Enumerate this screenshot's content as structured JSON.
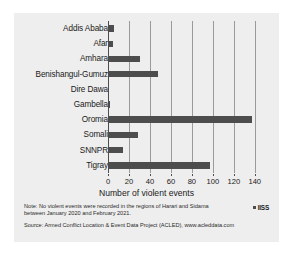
{
  "chart_data": {
    "type": "bar",
    "orientation": "horizontal",
    "title": "",
    "xlabel": "Number of violent events",
    "ylabel": "",
    "xlim": [
      0,
      145
    ],
    "xticks": [
      0,
      20,
      40,
      60,
      80,
      100,
      120,
      140
    ],
    "grid": true,
    "legend": false,
    "categories": [
      "Addis Ababa",
      "Afar",
      "Amhara",
      "Benishangul-Gumuz",
      "Dire Dawa",
      "Gambella",
      "Oromia",
      "Somali",
      "SNNPR",
      "Tigray"
    ],
    "values": [
      6,
      5,
      31,
      48,
      1,
      2,
      137,
      29,
      14,
      97
    ],
    "bar_color": "#4d4d4d",
    "plot_background": "#eeeeee"
  },
  "footer": {
    "note": "Note: No violent events were recorded in the regions of Harari and Sidama between January 2020 and February 2021.",
    "source": "Source: Armed Conflict Location & Event Data Project (ACLED), www.acleddata.com",
    "logo_text": "IISS"
  }
}
